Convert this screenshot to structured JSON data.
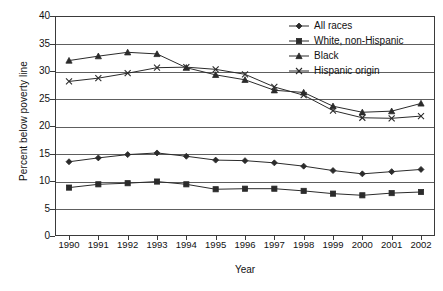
{
  "chart_data": {
    "type": "line",
    "title": "",
    "xlabel": "Year",
    "ylabel": "Percent below poverty line",
    "categories": [
      "1990",
      "1991",
      "1992",
      "1993",
      "1994",
      "1995",
      "1996",
      "1997",
      "1998",
      "1999",
      "2000",
      "2001",
      "2002"
    ],
    "x": [
      1990,
      1991,
      1992,
      1993,
      1994,
      1995,
      1996,
      1997,
      1998,
      1999,
      2000,
      2001,
      2002
    ],
    "ylim": [
      0,
      40
    ],
    "xlim": [
      1990,
      2002
    ],
    "yticks": [
      0,
      5,
      10,
      15,
      20,
      25,
      30,
      35,
      40
    ],
    "ytick_labels": [
      "0",
      "5",
      "10",
      "15",
      "20",
      "25",
      "30",
      "35",
      "40"
    ],
    "grid": "horizontal",
    "legend_position": "top-right",
    "series": [
      {
        "name": "All races",
        "marker": "diamond",
        "color": "#2b2b2b",
        "values": [
          13.5,
          14.2,
          14.8,
          15.1,
          14.5,
          13.8,
          13.7,
          13.3,
          12.7,
          11.9,
          11.3,
          11.7,
          12.1
        ]
      },
      {
        "name": "White, non-Hispanic",
        "marker": "square",
        "color": "#2b2b2b",
        "values": [
          8.8,
          9.4,
          9.6,
          9.9,
          9.4,
          8.5,
          8.6,
          8.6,
          8.2,
          7.7,
          7.4,
          7.8,
          8.0
        ]
      },
      {
        "name": "Black",
        "marker": "triangle",
        "color": "#2b2b2b",
        "values": [
          31.9,
          32.7,
          33.4,
          33.1,
          30.6,
          29.3,
          28.4,
          26.5,
          26.1,
          23.6,
          22.5,
          22.7,
          24.1
        ]
      },
      {
        "name": "Hispanic origin",
        "marker": "cross",
        "color": "#2b2b2b",
        "values": [
          28.1,
          28.7,
          29.6,
          30.6,
          30.7,
          30.3,
          29.4,
          27.1,
          25.6,
          22.8,
          21.5,
          21.4,
          21.8
        ]
      }
    ]
  },
  "axes": {
    "y_title": "Percent below poverty line",
    "x_title": "Year"
  },
  "legend": {
    "items": [
      {
        "label": "All races"
      },
      {
        "label": "White, non-Hispanic"
      },
      {
        "label": "Black"
      },
      {
        "label": "Hispanic origin"
      }
    ]
  }
}
